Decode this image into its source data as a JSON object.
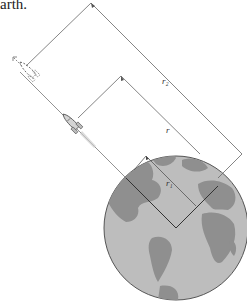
{
  "caption": {
    "text": "arth."
  },
  "diagram": {
    "labels": {
      "r1": "r₁",
      "r": "r",
      "r2": "r₂"
    },
    "objects": [
      {
        "name": "earth",
        "type": "globe"
      },
      {
        "name": "rocket-current",
        "type": "rocket",
        "style": "solid"
      },
      {
        "name": "rocket-later",
        "type": "rocket",
        "style": "dashed"
      }
    ],
    "colors": {
      "ocean": "#b9b9b9",
      "land": "#8e8e8e",
      "outline": "#555555",
      "lines": "#555555"
    }
  }
}
